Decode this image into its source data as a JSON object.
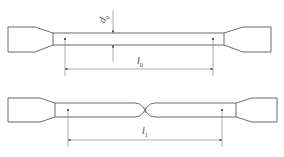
{
  "figure": {
    "line_color": "#5a5a5a",
    "background": "#ffffff"
  },
  "specimen_original": {
    "diameter_label": "d",
    "diameter_subscript": "0",
    "gauge_length_label": "l",
    "gauge_length_subscript": "0"
  },
  "specimen_fractured": {
    "gauge_length_label": "l",
    "gauge_length_subscript": "1"
  }
}
